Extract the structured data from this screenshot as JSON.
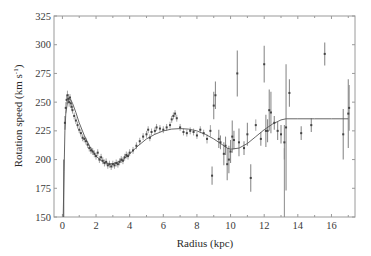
{
  "chart_data": {
    "type": "scatter",
    "title": "",
    "xlabel": "Radius (kpc)",
    "ylabel_main": "Rotation speed (km s",
    "ylabel_sup": "-1",
    "ylabel_close": ")",
    "xlim": [
      -0.5,
      17.4
    ],
    "ylim": [
      150,
      325
    ],
    "xticks": [
      0,
      2,
      4,
      6,
      8,
      10,
      12,
      14,
      16
    ],
    "xtick_labels": [
      "0",
      "2",
      "4",
      "6",
      "8",
      "10",
      "12",
      "14",
      "16"
    ],
    "yticks": [
      150,
      175,
      200,
      225,
      250,
      275,
      300,
      325
    ],
    "ytick_labels": [
      "150",
      "175",
      "200",
      "225",
      "250",
      "275",
      "300",
      "325"
    ],
    "grid": false,
    "colors": {
      "frame": "#9a9a9a",
      "points": "#444444",
      "errorbars": "#8c8c8c",
      "model": "#555555"
    },
    "model_curve": {
      "name": "rotation curve model",
      "x": [
        0.05,
        0.1,
        0.15,
        0.2,
        0.3,
        0.4,
        0.5,
        0.6,
        0.8,
        1.0,
        1.3,
        1.6,
        2.0,
        2.4,
        2.8,
        3.2,
        3.6,
        4.0,
        4.5,
        5.0,
        5.5,
        6.0,
        6.5,
        7.0,
        7.5,
        8.0,
        8.5,
        9.0,
        9.5,
        9.8,
        10.0,
        10.5,
        11.0,
        11.5,
        12.0,
        12.5,
        13.0,
        13.3,
        14.0,
        15.0,
        16.0,
        17.0
      ],
      "y": [
        150,
        190,
        225,
        240,
        250,
        253,
        252,
        249,
        241,
        232,
        221,
        212,
        203,
        198,
        196,
        197,
        200,
        205,
        212,
        218,
        222,
        225,
        226.5,
        227,
        226.5,
        225,
        222,
        218,
        213,
        210,
        209,
        210,
        214,
        220,
        226,
        231,
        234.5,
        235.5,
        235.5,
        235.5,
        235.5,
        235.5
      ]
    },
    "series": [
      {
        "name": "inner dense measurements",
        "points": [
          [
            0.15,
            232,
            6
          ],
          [
            0.2,
            245,
            5
          ],
          [
            0.25,
            252,
            4
          ],
          [
            0.3,
            256,
            4
          ],
          [
            0.35,
            253,
            4
          ],
          [
            0.4,
            250,
            4
          ],
          [
            0.45,
            254,
            3
          ],
          [
            0.5,
            249,
            4
          ],
          [
            0.55,
            246,
            3
          ],
          [
            0.6,
            243,
            3
          ],
          [
            0.7,
            238,
            3
          ],
          [
            0.8,
            234,
            3
          ],
          [
            0.9,
            230,
            3
          ],
          [
            1.0,
            226,
            3
          ],
          [
            1.1,
            223,
            3
          ],
          [
            1.2,
            219,
            3
          ],
          [
            1.3,
            218,
            3
          ],
          [
            1.4,
            216,
            3
          ],
          [
            1.5,
            213,
            3
          ],
          [
            1.6,
            210,
            3
          ],
          [
            1.7,
            208,
            3
          ],
          [
            1.8,
            207,
            3
          ],
          [
            1.9,
            205,
            3
          ],
          [
            2.0,
            203,
            3
          ],
          [
            2.1,
            206,
            3
          ],
          [
            2.2,
            200,
            3
          ],
          [
            2.3,
            202,
            3
          ],
          [
            2.4,
            199,
            3
          ],
          [
            2.5,
            197,
            3
          ],
          [
            2.6,
            198,
            3
          ],
          [
            2.7,
            195,
            3
          ],
          [
            2.8,
            196,
            3
          ],
          [
            2.9,
            194,
            3
          ],
          [
            3.0,
            196,
            3
          ],
          [
            3.1,
            195,
            3
          ],
          [
            3.2,
            197,
            3
          ],
          [
            3.3,
            196,
            3
          ],
          [
            3.4,
            198,
            3
          ],
          [
            3.5,
            200,
            3
          ],
          [
            3.6,
            199,
            3
          ],
          [
            3.7,
            202,
            3
          ],
          [
            3.8,
            204,
            3
          ],
          [
            3.9,
            203,
            3
          ],
          [
            4.0,
            206,
            3
          ],
          [
            4.2,
            208,
            3
          ],
          [
            4.4,
            212,
            3
          ],
          [
            4.6,
            216,
            3
          ],
          [
            4.8,
            220,
            3
          ],
          [
            5.0,
            222,
            3
          ],
          [
            5.1,
            226,
            3
          ],
          [
            5.2,
            219,
            3
          ],
          [
            5.3,
            224,
            3
          ],
          [
            5.5,
            225,
            3
          ],
          [
            5.6,
            228,
            3
          ],
          [
            5.8,
            227,
            3
          ],
          [
            6.0,
            226,
            3
          ],
          [
            6.2,
            228,
            3
          ],
          [
            6.4,
            230,
            3
          ],
          [
            6.5,
            235,
            3
          ],
          [
            6.6,
            238,
            3
          ],
          [
            6.7,
            240,
            3
          ],
          [
            6.8,
            236,
            3
          ],
          [
            7.0,
            228,
            3
          ],
          [
            7.2,
            224,
            3
          ],
          [
            7.4,
            223,
            3
          ],
          [
            7.6,
            225,
            3
          ],
          [
            7.8,
            224,
            3
          ],
          [
            8.0,
            221,
            3
          ],
          [
            8.2,
            226,
            3
          ],
          [
            8.4,
            223,
            3
          ],
          [
            8.6,
            218,
            4
          ]
        ]
      },
      {
        "name": "outer sparse measurements",
        "points": [
          [
            8.8,
            225,
            5
          ],
          [
            8.9,
            186,
            8
          ],
          [
            9.0,
            247,
            12
          ],
          [
            9.1,
            256,
            12
          ],
          [
            9.3,
            218,
            8
          ],
          [
            9.4,
            215,
            6
          ],
          [
            9.6,
            205,
            10
          ],
          [
            9.7,
            212,
            8
          ],
          [
            9.8,
            196,
            14
          ],
          [
            9.9,
            200,
            12
          ],
          [
            10.0,
            207,
            10
          ],
          [
            10.1,
            220,
            14
          ],
          [
            10.2,
            217,
            8
          ],
          [
            10.4,
            275,
            20
          ],
          [
            10.5,
            215,
            12
          ],
          [
            10.8,
            210,
            6
          ],
          [
            11.0,
            222,
            10
          ],
          [
            11.2,
            184,
            12
          ],
          [
            11.5,
            230,
            5
          ],
          [
            11.8,
            218,
            6
          ],
          [
            12.0,
            283,
            16
          ],
          [
            12.1,
            225,
            14
          ],
          [
            12.2,
            225,
            10
          ],
          [
            12.3,
            243,
            18
          ],
          [
            12.4,
            241,
            18
          ],
          [
            12.6,
            232,
            6
          ],
          [
            12.8,
            225,
            8
          ],
          [
            13.0,
            222,
            8
          ],
          [
            13.2,
            215,
            15
          ],
          [
            13.3,
            228,
            55
          ],
          [
            13.5,
            258,
            12
          ],
          [
            14.2,
            223,
            6
          ],
          [
            14.8,
            230,
            6
          ],
          [
            15.6,
            292,
            10
          ],
          [
            16.7,
            222,
            22
          ],
          [
            17.0,
            240,
            30
          ],
          [
            17.05,
            245,
            20
          ]
        ]
      }
    ]
  }
}
